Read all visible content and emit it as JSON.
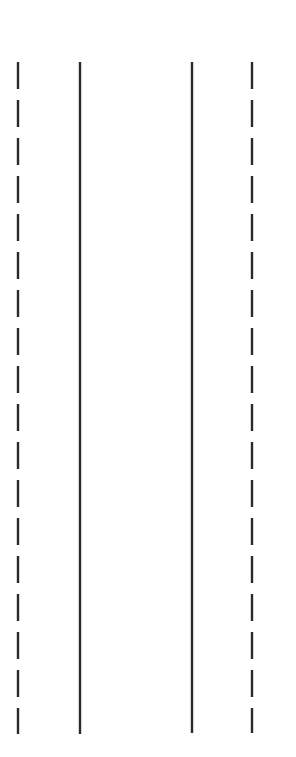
{
  "canvas": {
    "width": 296,
    "height": 757,
    "background": "#ffffff"
  },
  "lines": [
    {
      "id": "outer-left",
      "x": 18,
      "y1": 62,
      "y2": 734,
      "style": "dashed",
      "color": "#2a2a2a",
      "width": 2.4,
      "dash": "27 11"
    },
    {
      "id": "inner-left",
      "x": 80,
      "y1": 62,
      "y2": 734,
      "style": "solid",
      "color": "#2a2a2a",
      "width": 2.4
    },
    {
      "id": "inner-right",
      "x": 192,
      "y1": 62,
      "y2": 733,
      "style": "solid",
      "color": "#2a2a2a",
      "width": 2.4
    },
    {
      "id": "outer-right",
      "x": 252,
      "y1": 62,
      "y2": 733,
      "style": "dashed",
      "color": "#2a2a2a",
      "width": 2.4,
      "dash": "27 11"
    }
  ]
}
